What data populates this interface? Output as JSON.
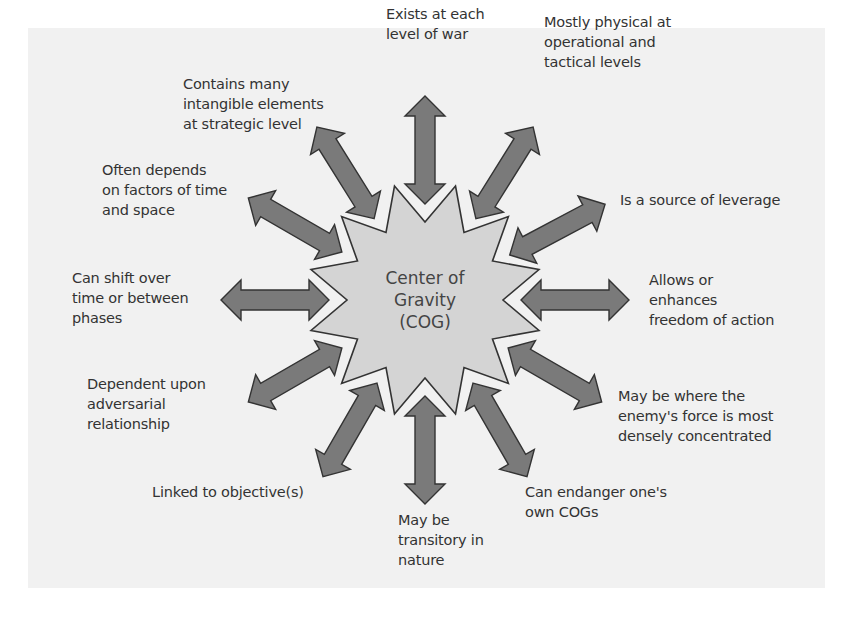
{
  "diagram": {
    "center": {
      "label": "Center of\nGravity\n(COG)",
      "shape": "12-point-star"
    },
    "colors": {
      "background": "#ffffff",
      "panel": "#f1f1f1",
      "star_fill": "#d4d4d4",
      "arrow_fill": "#7a7a7a",
      "outline": "#333333",
      "text": "#333333"
    },
    "characteristics": [
      {
        "id": "exists-each-level",
        "text": "Exists at each\nlevel of war",
        "angle": -90
      },
      {
        "id": "mostly-physical",
        "text": "Mostly physical at\noperational and\ntactical levels",
        "angle": -58
      },
      {
        "id": "source-of-leverage",
        "text": "Is a source of leverage",
        "angle": -28
      },
      {
        "id": "freedom-of-action",
        "text": "Allows or\nenhances\nfreedom of action",
        "angle": 0
      },
      {
        "id": "enemy-force-concentrated",
        "text": "May be where the\nenemy's force is most\ndensely concentrated",
        "angle": 30
      },
      {
        "id": "endanger-own-cogs",
        "text": "Can endanger one's\nown COGs",
        "angle": 60
      },
      {
        "id": "transitory",
        "text": "May be\ntransitory in\nnature",
        "angle": 90
      },
      {
        "id": "linked-to-objectives",
        "text": "Linked to objective(s)",
        "angle": 120
      },
      {
        "id": "adversarial-relationship",
        "text": "Dependent upon\nadversarial\nrelationship",
        "angle": 150
      },
      {
        "id": "shift-over-time",
        "text": "Can shift over\ntime or between\nphases",
        "angle": 180
      },
      {
        "id": "time-and-space",
        "text": "Often depends\non factors of time\nand space",
        "angle": 210
      },
      {
        "id": "intangible-elements",
        "text": "Contains many\nintangible elements\nat strategic level",
        "angle": 238
      }
    ]
  }
}
